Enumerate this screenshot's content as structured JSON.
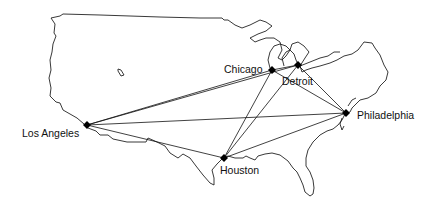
{
  "map": {
    "title": "",
    "colors": {
      "background": "#ffffff",
      "outline": "#222222",
      "route": "#111111",
      "node": "#000000"
    },
    "cities": [
      {
        "id": "chicago",
        "label": "Chicago",
        "x": 272,
        "y": 70
      },
      {
        "id": "detroit",
        "label": "Detroit",
        "x": 298,
        "y": 65
      },
      {
        "id": "philadelphia",
        "label": "Philadelphia",
        "x": 346,
        "y": 113
      },
      {
        "id": "los_angeles",
        "label": "Los Angeles",
        "x": 87,
        "y": 125
      },
      {
        "id": "houston",
        "label": "Houston",
        "x": 224,
        "y": 158
      }
    ],
    "routes": [
      [
        "los_angeles",
        "chicago"
      ],
      [
        "los_angeles",
        "detroit"
      ],
      [
        "los_angeles",
        "philadelphia"
      ],
      [
        "los_angeles",
        "houston"
      ],
      [
        "chicago",
        "detroit"
      ],
      [
        "chicago",
        "philadelphia"
      ],
      [
        "detroit",
        "philadelphia"
      ],
      [
        "chicago",
        "houston"
      ],
      [
        "detroit",
        "houston"
      ],
      [
        "houston",
        "philadelphia"
      ]
    ]
  }
}
